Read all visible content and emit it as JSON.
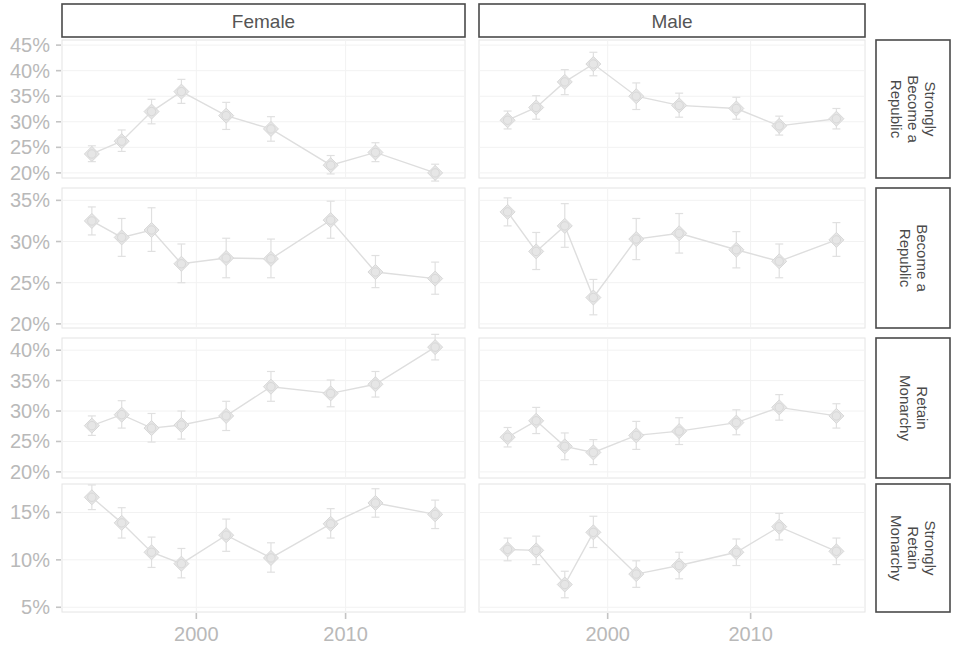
{
  "chart_data": {
    "type": "line",
    "title": "",
    "subtitle": "",
    "xlabel": "",
    "ylabel": "",
    "grid": true,
    "legend_position": "none",
    "error_bars": true,
    "facet_cols": [
      "Female",
      "Male"
    ],
    "facet_rows": [
      "Strongly Become a Republic",
      "Become a Republic",
      "Retain Monarchy",
      "Strongly Retain Monarchy"
    ],
    "x": [
      1993,
      1996,
      1998,
      2001,
      2004,
      2007,
      2010,
      2013,
      2016
    ],
    "xticks": [
      2000,
      2010
    ],
    "xtick_labels": [
      "2000",
      "2010"
    ],
    "xlim": [
      1991,
      2018
    ],
    "panels": [
      {
        "row": "Strongly Become a Republic",
        "col": "Female",
        "ylim": [
          19,
          46
        ],
        "yticks": [
          20,
          25,
          30,
          35,
          40,
          45
        ],
        "ytick_labels": [
          "20%",
          "25%",
          "30%",
          "35%",
          "40%",
          "45%"
        ],
        "x": [
          1993,
          1995,
          1997,
          1999,
          2001,
          2004,
          2007,
          2010,
          2013,
          2016
        ],
        "values": [
          23.7,
          26.2,
          32.0,
          35.9,
          31.2,
          28.6,
          21.5,
          24.0,
          20.0
        ],
        "points": [
          {
            "x": 1993,
            "y": 23.7,
            "lo": 22.2,
            "hi": 25.3
          },
          {
            "x": 1995,
            "y": 26.2,
            "lo": 24.2,
            "hi": 28.4
          },
          {
            "x": 1997,
            "y": 32.0,
            "lo": 29.6,
            "hi": 34.4
          },
          {
            "x": 1999,
            "y": 35.9,
            "lo": 33.6,
            "hi": 38.3
          },
          {
            "x": 2002,
            "y": 31.2,
            "lo": 28.5,
            "hi": 33.8
          },
          {
            "x": 2005,
            "y": 28.6,
            "lo": 26.2,
            "hi": 31.0
          },
          {
            "x": 2009,
            "y": 21.5,
            "lo": 19.8,
            "hi": 23.4
          },
          {
            "x": 2012,
            "y": 24.0,
            "lo": 22.2,
            "hi": 25.9
          },
          {
            "x": 2016,
            "y": 20.0,
            "lo": 18.4,
            "hi": 21.7
          }
        ]
      },
      {
        "row": "Strongly Become a Republic",
        "col": "Male",
        "ylim": [
          19,
          46
        ],
        "yticks": [
          20,
          25,
          30,
          35,
          40,
          45
        ],
        "ytick_labels": [
          "20%",
          "25%",
          "30%",
          "35%",
          "40%",
          "45%"
        ],
        "points": [
          {
            "x": 1993,
            "y": 30.3,
            "lo": 28.6,
            "hi": 32.1
          },
          {
            "x": 1995,
            "y": 32.8,
            "lo": 30.5,
            "hi": 35.1
          },
          {
            "x": 1997,
            "y": 37.8,
            "lo": 35.3,
            "hi": 40.2
          },
          {
            "x": 1999,
            "y": 41.3,
            "lo": 39.0,
            "hi": 43.6
          },
          {
            "x": 2002,
            "y": 35.0,
            "lo": 32.4,
            "hi": 37.6
          },
          {
            "x": 2005,
            "y": 33.2,
            "lo": 30.9,
            "hi": 35.6
          },
          {
            "x": 2009,
            "y": 32.6,
            "lo": 30.5,
            "hi": 34.8
          },
          {
            "x": 2012,
            "y": 29.2,
            "lo": 27.4,
            "hi": 31.1
          },
          {
            "x": 2016,
            "y": 30.6,
            "lo": 28.6,
            "hi": 32.6
          }
        ]
      },
      {
        "row": "Become a Republic",
        "col": "Female",
        "ylim": [
          19.5,
          36.5
        ],
        "yticks": [
          20,
          25,
          30,
          35
        ],
        "ytick_labels": [
          "20%",
          "25%",
          "30%",
          "35%"
        ],
        "points": [
          {
            "x": 1993,
            "y": 32.5,
            "lo": 30.8,
            "hi": 34.2
          },
          {
            "x": 1995,
            "y": 30.5,
            "lo": 28.2,
            "hi": 32.8
          },
          {
            "x": 1997,
            "y": 31.4,
            "lo": 28.8,
            "hi": 34.1
          },
          {
            "x": 1999,
            "y": 27.3,
            "lo": 25.0,
            "hi": 29.7
          },
          {
            "x": 2002,
            "y": 28.0,
            "lo": 25.6,
            "hi": 30.4
          },
          {
            "x": 2005,
            "y": 27.9,
            "lo": 25.6,
            "hi": 30.3
          },
          {
            "x": 2009,
            "y": 32.6,
            "lo": 30.4,
            "hi": 34.9
          },
          {
            "x": 2012,
            "y": 26.3,
            "lo": 24.4,
            "hi": 28.3
          },
          {
            "x": 2016,
            "y": 25.5,
            "lo": 23.6,
            "hi": 27.5
          }
        ]
      },
      {
        "row": "Become a Republic",
        "col": "Male",
        "ylim": [
          19.5,
          36.5
        ],
        "yticks": [
          20,
          25,
          30,
          35
        ],
        "ytick_labels": [
          "20%",
          "25%",
          "30%",
          "35%"
        ],
        "points": [
          {
            "x": 1993,
            "y": 33.6,
            "lo": 31.9,
            "hi": 35.3
          },
          {
            "x": 1995,
            "y": 28.8,
            "lo": 26.6,
            "hi": 31.1
          },
          {
            "x": 1997,
            "y": 31.9,
            "lo": 29.3,
            "hi": 34.6
          },
          {
            "x": 1999,
            "y": 23.2,
            "lo": 21.1,
            "hi": 25.4
          },
          {
            "x": 2002,
            "y": 30.3,
            "lo": 27.8,
            "hi": 32.8
          },
          {
            "x": 2005,
            "y": 31.0,
            "lo": 28.6,
            "hi": 33.4
          },
          {
            "x": 2009,
            "y": 29.0,
            "lo": 26.8,
            "hi": 31.2
          },
          {
            "x": 2012,
            "y": 27.6,
            "lo": 25.6,
            "hi": 29.7
          },
          {
            "x": 2016,
            "y": 30.2,
            "lo": 28.2,
            "hi": 32.3
          }
        ]
      },
      {
        "row": "Retain Monarchy",
        "col": "Female",
        "ylim": [
          19,
          42
        ],
        "yticks": [
          20,
          25,
          30,
          35,
          40
        ],
        "ytick_labels": [
          "20%",
          "25%",
          "30%",
          "35%",
          "40%"
        ],
        "points": [
          {
            "x": 1993,
            "y": 27.6,
            "lo": 26.0,
            "hi": 29.2
          },
          {
            "x": 1995,
            "y": 29.4,
            "lo": 27.2,
            "hi": 31.7
          },
          {
            "x": 1997,
            "y": 27.2,
            "lo": 24.9,
            "hi": 29.6
          },
          {
            "x": 1999,
            "y": 27.7,
            "lo": 25.4,
            "hi": 30.0
          },
          {
            "x": 2002,
            "y": 29.2,
            "lo": 26.8,
            "hi": 31.6
          },
          {
            "x": 2005,
            "y": 34.0,
            "lo": 31.6,
            "hi": 36.5
          },
          {
            "x": 2009,
            "y": 32.9,
            "lo": 30.7,
            "hi": 35.1
          },
          {
            "x": 2012,
            "y": 34.4,
            "lo": 32.3,
            "hi": 36.5
          },
          {
            "x": 2016,
            "y": 40.5,
            "lo": 38.4,
            "hi": 42.6
          }
        ]
      },
      {
        "row": "Retain Monarchy",
        "col": "Male",
        "ylim": [
          19,
          42
        ],
        "yticks": [
          20,
          25,
          30,
          35,
          40
        ],
        "ytick_labels": [
          "20%",
          "25%",
          "30%",
          "35%",
          "40%"
        ],
        "points": [
          {
            "x": 1993,
            "y": 25.7,
            "lo": 24.1,
            "hi": 27.3
          },
          {
            "x": 1995,
            "y": 28.4,
            "lo": 26.3,
            "hi": 30.6
          },
          {
            "x": 1997,
            "y": 24.2,
            "lo": 22.0,
            "hi": 26.4
          },
          {
            "x": 1999,
            "y": 23.2,
            "lo": 21.2,
            "hi": 25.3
          },
          {
            "x": 2002,
            "y": 26.0,
            "lo": 23.7,
            "hi": 28.3
          },
          {
            "x": 2005,
            "y": 26.7,
            "lo": 24.5,
            "hi": 28.9
          },
          {
            "x": 2009,
            "y": 28.1,
            "lo": 26.1,
            "hi": 30.2
          },
          {
            "x": 2012,
            "y": 30.6,
            "lo": 28.5,
            "hi": 32.7
          },
          {
            "x": 2016,
            "y": 29.2,
            "lo": 27.2,
            "hi": 31.2
          }
        ]
      },
      {
        "row": "Strongly Retain Monarchy",
        "col": "Female",
        "ylim": [
          4.5,
          18
        ],
        "yticks": [
          5,
          10,
          15
        ],
        "ytick_labels": [
          "5%",
          "10%",
          "15%"
        ],
        "points": [
          {
            "x": 1993,
            "y": 16.6,
            "lo": 15.3,
            "hi": 17.9
          },
          {
            "x": 1995,
            "y": 13.9,
            "lo": 12.3,
            "hi": 15.5
          },
          {
            "x": 1997,
            "y": 10.8,
            "lo": 9.2,
            "hi": 12.4
          },
          {
            "x": 1999,
            "y": 9.6,
            "lo": 8.1,
            "hi": 11.2
          },
          {
            "x": 2002,
            "y": 12.6,
            "lo": 10.9,
            "hi": 14.3
          },
          {
            "x": 2005,
            "y": 10.2,
            "lo": 8.7,
            "hi": 11.8
          },
          {
            "x": 2009,
            "y": 13.8,
            "lo": 12.3,
            "hi": 15.4
          },
          {
            "x": 2012,
            "y": 16.0,
            "lo": 14.5,
            "hi": 17.5
          },
          {
            "x": 2016,
            "y": 14.8,
            "lo": 13.3,
            "hi": 16.3
          }
        ]
      },
      {
        "row": "Strongly Retain Monarchy",
        "col": "Male",
        "ylim": [
          4.5,
          18
        ],
        "yticks": [
          5,
          10,
          15
        ],
        "ytick_labels": [
          "5%",
          "10%",
          "15%"
        ],
        "points": [
          {
            "x": 1993,
            "y": 11.1,
            "lo": 9.9,
            "hi": 12.3
          },
          {
            "x": 1995,
            "y": 11.0,
            "lo": 9.5,
            "hi": 12.5
          },
          {
            "x": 1997,
            "y": 7.4,
            "lo": 6.0,
            "hi": 8.8
          },
          {
            "x": 1999,
            "y": 12.9,
            "lo": 11.3,
            "hi": 14.6
          },
          {
            "x": 2002,
            "y": 8.5,
            "lo": 7.1,
            "hi": 9.9
          },
          {
            "x": 2005,
            "y": 9.4,
            "lo": 8.0,
            "hi": 10.8
          },
          {
            "x": 2009,
            "y": 10.8,
            "lo": 9.4,
            "hi": 12.2
          },
          {
            "x": 2012,
            "y": 13.5,
            "lo": 12.1,
            "hi": 14.9
          },
          {
            "x": 2016,
            "y": 10.9,
            "lo": 9.5,
            "hi": 12.3
          }
        ]
      }
    ],
    "colors": {
      "line": "#dedede",
      "marker_fill": "#e6e6e6",
      "marker_stroke": "#d8d8d8",
      "error_bar": "#e0e0e0",
      "axis_text": "#b9b9b9",
      "strip_text": "#4a4a4a",
      "strip_border": "#4a4a4a",
      "panel_border": "#e4e4e4",
      "background": "#ffffff"
    }
  },
  "strips": {
    "col_female": "Female",
    "col_male": "Male",
    "row_1": "Strongly Become a Republic",
    "row_2": "Become a Republic",
    "row_3": "Retain Monarchy",
    "row_4": "Strongly Retain Monarchy"
  },
  "axis": {
    "x_tick_1": "2000",
    "x_tick_2": "2010"
  }
}
